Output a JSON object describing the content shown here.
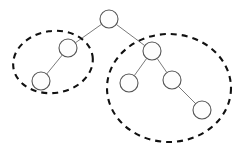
{
  "figure": {
    "canvas": {
      "width": 237,
      "height": 146,
      "background": "#ffffff"
    }
  },
  "chart_data": {
    "type": "diagram",
    "diagram_kind": "node-link tree with cluster rings",
    "title": "",
    "node_style": {
      "radius": 9,
      "fill": "#fdfdfd",
      "stroke": "#555555"
    },
    "edge_style": {
      "stroke": "#6b6b6b",
      "width": 0.9
    },
    "cluster_style": {
      "stroke": "#111111",
      "width": 2.1,
      "dash": "6 5"
    },
    "nodes": [
      {
        "id": "root",
        "label": "",
        "x": 109,
        "y": 19,
        "r": 9,
        "cluster": null
      },
      {
        "id": "L1",
        "label": "",
        "x": 68,
        "y": 48,
        "r": 9,
        "cluster": "left"
      },
      {
        "id": "L2",
        "label": "",
        "x": 41,
        "y": 81,
        "r": 9,
        "cluster": "left"
      },
      {
        "id": "R1",
        "label": "",
        "x": 152,
        "y": 51,
        "r": 9,
        "cluster": "right"
      },
      {
        "id": "R2",
        "label": "",
        "x": 129,
        "y": 83,
        "r": 9,
        "cluster": "right"
      },
      {
        "id": "R3",
        "label": "",
        "x": 172,
        "y": 80,
        "r": 9,
        "cluster": "right"
      },
      {
        "id": "R4",
        "label": "",
        "x": 202,
        "y": 110,
        "r": 9,
        "cluster": "right"
      }
    ],
    "edges": [
      {
        "from": "root",
        "to": "L1"
      },
      {
        "from": "root",
        "to": "R1"
      },
      {
        "from": "L1",
        "to": "L2"
      },
      {
        "from": "R1",
        "to": "R2"
      },
      {
        "from": "R1",
        "to": "R3"
      },
      {
        "from": "R3",
        "to": "R4"
      }
    ],
    "clusters": [
      {
        "id": "left",
        "label": "",
        "cx": 53,
        "cy": 62,
        "rx": 40,
        "ry": 31,
        "rotation": -8,
        "members": [
          "L1",
          "L2"
        ]
      },
      {
        "id": "right",
        "label": "",
        "cx": 169,
        "cy": 88,
        "rx": 62,
        "ry": 54,
        "rotation": 0,
        "members": [
          "R1",
          "R2",
          "R3",
          "R4"
        ]
      }
    ]
  }
}
